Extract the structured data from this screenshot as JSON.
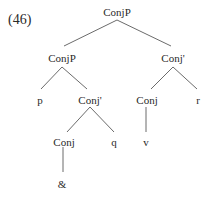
{
  "example_number": "(46)",
  "tree": {
    "root": "ConjP",
    "nodes": {
      "root": {
        "label": "ConjP",
        "x": 117,
        "y": 6
      },
      "left_conjp": {
        "label": "ConjP",
        "x": 62,
        "y": 52
      },
      "right_conjbar": {
        "label": "Conj'",
        "x": 173,
        "y": 52
      },
      "p": {
        "label": "p",
        "x": 40,
        "y": 94
      },
      "mid_conjbar": {
        "label": "Conj'",
        "x": 90,
        "y": 94
      },
      "right_conj": {
        "label": "Conj",
        "x": 147,
        "y": 94
      },
      "r": {
        "label": "r",
        "x": 198,
        "y": 94
      },
      "lower_conj": {
        "label": "Conj",
        "x": 64,
        "y": 136
      },
      "q": {
        "label": "q",
        "x": 114,
        "y": 136
      },
      "v": {
        "label": "v",
        "x": 146,
        "y": 136
      },
      "amp": {
        "label": "&",
        "x": 62,
        "y": 178
      }
    },
    "edges": [
      {
        "from": "root",
        "to": "left_conjp",
        "x1": 117,
        "y1": 20,
        "x2": 64,
        "y2": 46
      },
      {
        "from": "root",
        "to": "right_conjbar",
        "x1": 117,
        "y1": 20,
        "x2": 171,
        "y2": 46
      },
      {
        "from": "left_conjp",
        "to": "p",
        "x1": 62,
        "y1": 67,
        "x2": 41,
        "y2": 89
      },
      {
        "from": "left_conjp",
        "to": "mid_conjbar",
        "x1": 62,
        "y1": 67,
        "x2": 87,
        "y2": 89
      },
      {
        "from": "right_conjbar",
        "to": "right_conj",
        "x1": 173,
        "y1": 67,
        "x2": 151,
        "y2": 89
      },
      {
        "from": "right_conjbar",
        "to": "r",
        "x1": 173,
        "y1": 67,
        "x2": 197,
        "y2": 89
      },
      {
        "from": "mid_conjbar",
        "to": "lower_conj",
        "x1": 90,
        "y1": 107,
        "x2": 67,
        "y2": 132
      },
      {
        "from": "mid_conjbar",
        "to": "q",
        "x1": 90,
        "y1": 107,
        "x2": 114,
        "y2": 132
      },
      {
        "from": "right_conj",
        "to": "v",
        "x1": 146,
        "y1": 107,
        "x2": 146,
        "y2": 132
      },
      {
        "from": "lower_conj",
        "to": "amp",
        "x1": 63,
        "y1": 147,
        "x2": 63,
        "y2": 172
      }
    ]
  },
  "colors": {
    "text": "#2a2a2a",
    "edge": "#6b6b6b",
    "background": "#ffffff"
  }
}
